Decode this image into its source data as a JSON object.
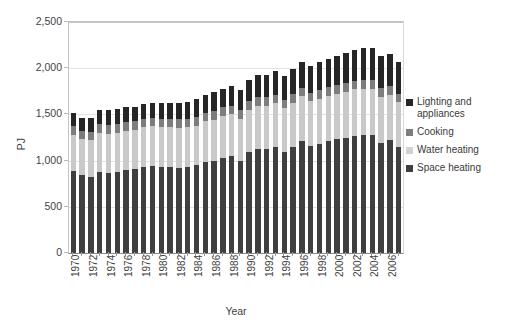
{
  "chart_data": {
    "type": "bar",
    "subtype": "stacked-column",
    "title": "",
    "xlabel": "Year",
    "ylabel": "PJ",
    "ylim": [
      0,
      2500
    ],
    "ytick_step": 500,
    "ytick_labels": [
      "0",
      "500",
      "1,000",
      "1,500",
      "2,000",
      "2,500"
    ],
    "ytick_values": [
      0,
      500,
      1000,
      1500,
      2000,
      2500
    ],
    "grid": true,
    "legend_position": "right",
    "xtick_step": 2,
    "categories": [
      "1970",
      "1971",
      "1972",
      "1973",
      "1974",
      "1975",
      "1976",
      "1977",
      "1978",
      "1979",
      "1980",
      "1981",
      "1982",
      "1983",
      "1984",
      "1985",
      "1986",
      "1987",
      "1988",
      "1989",
      "1990",
      "1991",
      "1992",
      "1993",
      "1994",
      "1995",
      "1996",
      "1997",
      "1998",
      "1999",
      "2000",
      "2001",
      "2002",
      "2003",
      "2004",
      "2005",
      "2006",
      "2007"
    ],
    "xtick_labels": [
      "1970",
      "1972",
      "1974",
      "1976",
      "1978",
      "1980",
      "1982",
      "1984",
      "1986",
      "1988",
      "1990",
      "1992",
      "1994",
      "1996",
      "1998",
      "2000",
      "2002",
      "2004",
      "2006"
    ],
    "series": [
      {
        "name": "Space heating",
        "color": "#3f3f3f",
        "values": [
          890,
          840,
          820,
          880,
          870,
          880,
          900,
          910,
          930,
          940,
          930,
          930,
          925,
          930,
          950,
          985,
          1000,
          1030,
          1045,
          1000,
          1090,
          1130,
          1125,
          1150,
          1095,
          1150,
          1215,
          1160,
          1185,
          1210,
          1230,
          1250,
          1270,
          1280,
          1275,
          1195,
          1220,
          1150
        ]
      },
      {
        "name": "Water heating",
        "color": "#c9c9c9",
        "values": [
          390,
          390,
          400,
          420,
          420,
          420,
          425,
          425,
          430,
          430,
          430,
          430,
          430,
          430,
          430,
          440,
          445,
          450,
          455,
          455,
          460,
          465,
          465,
          470,
          470,
          475,
          480,
          480,
          485,
          490,
          495,
          495,
          500,
          500,
          500,
          495,
          490,
          480
        ]
      },
      {
        "name": "Cooking",
        "color": "#7d7d7d",
        "values": [
          100,
          95,
          95,
          95,
          95,
          95,
          95,
          95,
          95,
          95,
          95,
          95,
          95,
          95,
          95,
          95,
          95,
          95,
          95,
          95,
          95,
          95,
          95,
          95,
          95,
          95,
          95,
          95,
          95,
          95,
          95,
          95,
          95,
          95,
          95,
          95,
          95,
          95
        ]
      },
      {
        "name": "Lighting and appliances",
        "color": "#262626",
        "values": [
          135,
          140,
          150,
          150,
          160,
          160,
          160,
          155,
          155,
          160,
          165,
          170,
          175,
          180,
          190,
          195,
          200,
          205,
          210,
          215,
          225,
          235,
          245,
          250,
          260,
          270,
          280,
          290,
          300,
          305,
          315,
          320,
          330,
          340,
          345,
          350,
          350,
          345
        ]
      }
    ],
    "legend": [
      {
        "label": "Lighting and\nappliances",
        "color": "#262626"
      },
      {
        "label": "Cooking",
        "color": "#7d7d7d"
      },
      {
        "label": "Water heating",
        "color": "#d2d2d2"
      },
      {
        "label": "Space heating",
        "color": "#3f3f3f"
      }
    ]
  }
}
